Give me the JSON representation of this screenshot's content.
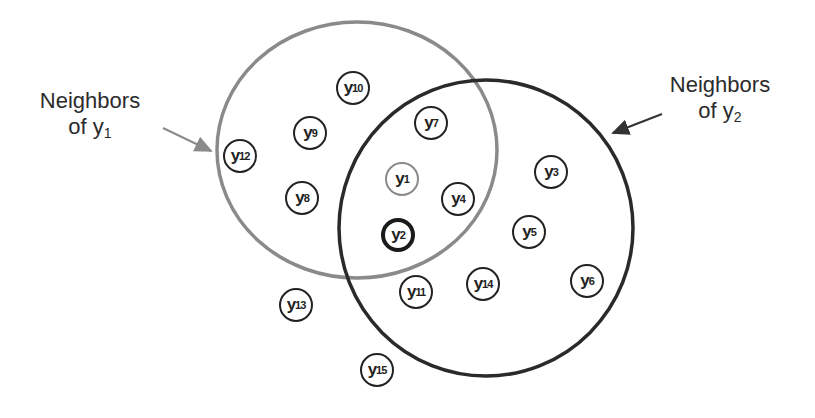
{
  "labels": {
    "left": {
      "line1": "Neighbors",
      "line2_prefix": "of ",
      "var": "y",
      "sub": "1"
    },
    "right": {
      "line1": "Neighbors",
      "line2_prefix": "of ",
      "var": "y",
      "sub": "2"
    }
  },
  "colors": {
    "neighborhood_y1": "#8a8a8a",
    "neighborhood_y2": "#222222",
    "node_border": "#222222"
  },
  "nodes": [
    {
      "id": "y10",
      "var": "y",
      "sub": "10",
      "x": 353,
      "y": 88,
      "style": "normal"
    },
    {
      "id": "y7",
      "var": "y",
      "sub": "7",
      "x": 431,
      "y": 123,
      "style": "normal"
    },
    {
      "id": "y9",
      "var": "y",
      "sub": "9",
      "x": 310,
      "y": 133,
      "style": "normal"
    },
    {
      "id": "y12",
      "var": "y",
      "sub": "12",
      "x": 240,
      "y": 156,
      "style": "normal"
    },
    {
      "id": "y1",
      "var": "y",
      "sub": "1",
      "x": 402,
      "y": 179,
      "style": "gray"
    },
    {
      "id": "y8",
      "var": "y",
      "sub": "8",
      "x": 302,
      "y": 198,
      "style": "normal"
    },
    {
      "id": "y4",
      "var": "y",
      "sub": "4",
      "x": 458,
      "y": 199,
      "style": "normal"
    },
    {
      "id": "y3",
      "var": "y",
      "sub": "3",
      "x": 551,
      "y": 172,
      "style": "normal"
    },
    {
      "id": "y2",
      "var": "y",
      "sub": "2",
      "x": 398,
      "y": 235,
      "style": "thick"
    },
    {
      "id": "y5",
      "var": "y",
      "sub": "5",
      "x": 529,
      "y": 232,
      "style": "normal"
    },
    {
      "id": "y14",
      "var": "y",
      "sub": "14",
      "x": 483,
      "y": 284,
      "style": "normal"
    },
    {
      "id": "y11",
      "var": "y",
      "sub": "11",
      "x": 416,
      "y": 292,
      "style": "normal"
    },
    {
      "id": "y6",
      "var": "y",
      "sub": "6",
      "x": 587,
      "y": 281,
      "style": "normal"
    },
    {
      "id": "y13",
      "var": "y",
      "sub": "13",
      "x": 296,
      "y": 305,
      "style": "normal"
    },
    {
      "id": "y15",
      "var": "y",
      "sub": "15",
      "x": 377,
      "y": 370,
      "style": "normal"
    }
  ]
}
